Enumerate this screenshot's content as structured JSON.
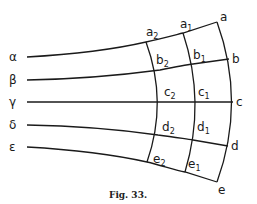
{
  "figure": {
    "caption": "Fig. 33.",
    "left_labels": [
      "α",
      "β",
      "γ",
      "δ",
      "ε"
    ],
    "edge_labels": [
      "a",
      "b",
      "c",
      "d",
      "e"
    ],
    "column1_labels": [
      {
        "base": "a",
        "sub": "1"
      },
      {
        "base": "b",
        "sub": "1"
      },
      {
        "base": "c",
        "sub": "1"
      },
      {
        "base": "d",
        "sub": "1"
      },
      {
        "base": "e",
        "sub": "1"
      }
    ],
    "column2_labels": [
      {
        "base": "a",
        "sub": "2"
      },
      {
        "base": "b",
        "sub": "2"
      },
      {
        "base": "c",
        "sub": "2"
      },
      {
        "base": "d",
        "sub": "2"
      },
      {
        "base": "e",
        "sub": "2"
      }
    ]
  }
}
